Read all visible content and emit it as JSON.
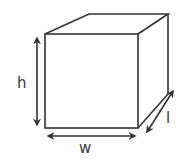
{
  "diagram": {
    "type": "box-dimensions",
    "labels": {
      "height": "h",
      "width": "w",
      "length": "l"
    },
    "colors": {
      "stroke": "#333333",
      "label": "#3a3a3a",
      "background": "#ffffff"
    }
  }
}
